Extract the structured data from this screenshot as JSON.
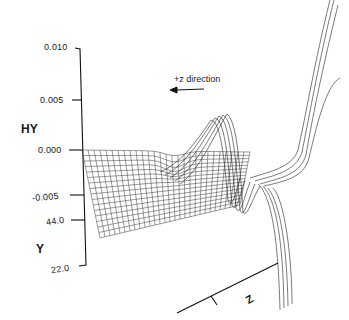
{
  "chart_data": {
    "type": "surface",
    "title": "",
    "zlabel": "HY",
    "ylabel": "Y",
    "xlabel": "Z",
    "hy_ticks": [
      "0.010",
      "0.005",
      "0.000",
      "-0.005"
    ],
    "hy_range": [
      -0.005,
      0.01
    ],
    "y_ticks": [
      "44.0",
      "22.0"
    ],
    "annotation": "+z direction",
    "annotation_arrow": "left",
    "grid": false
  },
  "labels": {
    "tick_0010": "0.010",
    "tick_0005": "0.005",
    "tick_0000": "0.000",
    "tick_m0005": "-0.005",
    "tick_44": "44.0",
    "tick_22": "22.0",
    "hy": "HY",
    "y": "Y",
    "z": "Z",
    "direction": "+z direction"
  }
}
